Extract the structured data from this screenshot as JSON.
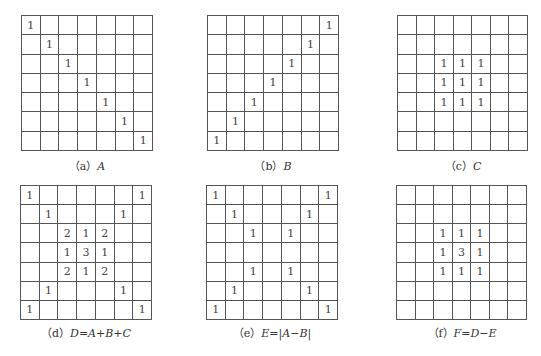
{
  "panels": [
    {
      "id": "a",
      "label": "（a）",
      "formula": "A",
      "grid": [
        [
          "1",
          "",
          "",
          "",
          "",
          "",
          ""
        ],
        [
          "",
          "1",
          "",
          "",
          "",
          "",
          ""
        ],
        [
          "",
          "",
          "1",
          "",
          "",
          "",
          ""
        ],
        [
          "",
          "",
          "",
          "1",
          "",
          "",
          ""
        ],
        [
          "",
          "",
          "",
          "",
          "1",
          "",
          ""
        ],
        [
          "",
          "",
          "",
          "",
          "",
          "1",
          ""
        ],
        [
          "",
          "",
          "",
          "",
          "",
          "",
          "1"
        ]
      ]
    },
    {
      "id": "b",
      "label": "（b）",
      "formula": "B",
      "grid": [
        [
          "",
          "",
          "",
          "",
          "",
          "",
          "1"
        ],
        [
          "",
          "",
          "",
          "",
          "",
          "1",
          ""
        ],
        [
          "",
          "",
          "",
          "",
          "1",
          "",
          ""
        ],
        [
          "",
          "",
          "",
          "1",
          "",
          "",
          ""
        ],
        [
          "",
          "",
          "1",
          "",
          "",
          "",
          ""
        ],
        [
          "",
          "1",
          "",
          "",
          "",
          "",
          ""
        ],
        [
          "1",
          "",
          "",
          "",
          "",
          "",
          ""
        ]
      ]
    },
    {
      "id": "c",
      "label": "（c）",
      "formula": "C",
      "grid": [
        [
          "",
          "",
          "",
          "",
          "",
          "",
          ""
        ],
        [
          "",
          "",
          "",
          "",
          "",
          "",
          ""
        ],
        [
          "",
          "",
          "1",
          "1",
          "1",
          "",
          ""
        ],
        [
          "",
          "",
          "1",
          "1",
          "1",
          "",
          ""
        ],
        [
          "",
          "",
          "1",
          "1",
          "1",
          "",
          ""
        ],
        [
          "",
          "",
          "",
          "",
          "",
          "",
          ""
        ],
        [
          "",
          "",
          "",
          "",
          "",
          "",
          ""
        ]
      ]
    },
    {
      "id": "d",
      "label": "（d）",
      "formula": "D=A+B+C",
      "grid": [
        [
          "1",
          "",
          "",
          "",
          "",
          "",
          "1"
        ],
        [
          "",
          "1",
          "",
          "",
          "",
          "1",
          ""
        ],
        [
          "",
          "",
          "2",
          "1",
          "2",
          "",
          ""
        ],
        [
          "",
          "",
          "1",
          "3",
          "1",
          "",
          ""
        ],
        [
          "",
          "",
          "2",
          "1",
          "2",
          "",
          ""
        ],
        [
          "",
          "1",
          "",
          "",
          "",
          "1",
          ""
        ],
        [
          "1",
          "",
          "",
          "",
          "",
          "",
          "1"
        ]
      ]
    },
    {
      "id": "e",
      "label": "（e）",
      "formula": "E=|A−B|",
      "grid": [
        [
          "1",
          "",
          "",
          "",
          "",
          "",
          "1"
        ],
        [
          "",
          "1",
          "",
          "",
          "",
          "1",
          ""
        ],
        [
          "",
          "",
          "1",
          "",
          "1",
          "",
          ""
        ],
        [
          "",
          "",
          "",
          "",
          "",
          "",
          ""
        ],
        [
          "",
          "",
          "1",
          "",
          "1",
          "",
          ""
        ],
        [
          "",
          "1",
          "",
          "",
          "",
          "1",
          ""
        ],
        [
          "1",
          "",
          "",
          "",
          "",
          "",
          "1"
        ]
      ]
    },
    {
      "id": "f",
      "label": "（f）",
      "formula": "F=D−E",
      "grid": [
        [
          "",
          "",
          "",
          "",
          "",
          "",
          ""
        ],
        [
          "",
          "",
          "",
          "",
          "",
          "",
          ""
        ],
        [
          "",
          "",
          "1",
          "1",
          "1",
          "",
          ""
        ],
        [
          "",
          "",
          "1",
          "3",
          "1",
          "",
          ""
        ],
        [
          "",
          "",
          "1",
          "1",
          "1",
          "",
          ""
        ],
        [
          "",
          "",
          "",
          "",
          "",
          "",
          ""
        ],
        [
          "",
          "",
          "",
          "",
          "",
          "",
          ""
        ]
      ]
    }
  ]
}
